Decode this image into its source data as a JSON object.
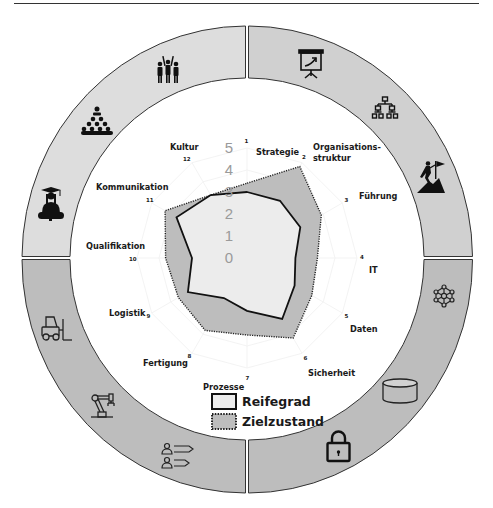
{
  "chart_data": {
    "type": "radar",
    "title": "",
    "center_group_label": "Prozesse",
    "axes": [
      {
        "index": "1",
        "label": "Strategie"
      },
      {
        "index": "2",
        "label": "Organisations-",
        "label_line2": "struktur"
      },
      {
        "index": "3",
        "label": "Führung"
      },
      {
        "index": "4",
        "label": "IT"
      },
      {
        "index": "5",
        "label": "Daten"
      },
      {
        "index": "6",
        "label": "Sicherheit"
      },
      {
        "index": "7",
        "label": "Prozesse"
      },
      {
        "index": "8",
        "label": "Fertigung"
      },
      {
        "index": "9",
        "label": "Logistik"
      },
      {
        "index": "10",
        "label": "Qualifikation"
      },
      {
        "index": "11",
        "label": "Kommunikation"
      },
      {
        "index": "12",
        "label": "Kultur"
      }
    ],
    "categories": [
      "Strategie",
      "Organisationsstruktur",
      "Führung",
      "IT",
      "Daten",
      "Sicherheit",
      "Prozesse",
      "Fertigung",
      "Logistik",
      "Qualifikation",
      "Kommunikation",
      "Kultur"
    ],
    "radial_ticks": [
      "0",
      "1",
      "2",
      "3",
      "4",
      "5"
    ],
    "rlim": [
      0,
      5
    ],
    "series": [
      {
        "name": "Reifegrad",
        "values": [
          3.0,
          3.0,
          2.8,
          2.2,
          2.5,
          3.2,
          2.4,
          2.1,
          3.1,
          2.5,
          3.7,
          3.3
        ],
        "fill": "#ececec",
        "stroke": "#111111",
        "line_style": "solid"
      },
      {
        "name": "Zielzustand",
        "values": [
          3.4,
          4.8,
          3.9,
          3.2,
          3.4,
          4.2,
          3.5,
          3.8,
          3.6,
          3.7,
          4.3,
          3.3
        ],
        "fill": "#bdbdbd",
        "stroke": "#222222",
        "line_style": "dotted"
      }
    ],
    "legend": [
      {
        "label": "Reifegrad",
        "style": "solid"
      },
      {
        "label": "Zielzustand",
        "style": "dotted"
      }
    ],
    "legend_position": "bottom-center",
    "grid": true
  },
  "ring": {
    "quadrants": [
      {
        "name": "top-left",
        "color": "#dddddd",
        "icons": [
          "team-celebration-icon",
          "hierarchy-people-icon",
          "graduate-icon"
        ]
      },
      {
        "name": "top-right",
        "color": "#d0d0d0",
        "icons": [
          "presentation-board-icon",
          "org-chart-icon",
          "summit-flag-icon"
        ]
      },
      {
        "name": "bottom-right",
        "color": "#bdbdbd",
        "icons": [
          "network-nodes-icon",
          "database-icon",
          "padlock-icon"
        ]
      },
      {
        "name": "bottom-left",
        "color": "#bdbdbd",
        "icons": [
          "forklift-icon",
          "robot-arm-icon",
          "process-people-icon"
        ]
      }
    ]
  }
}
